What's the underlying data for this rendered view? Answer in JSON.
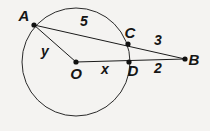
{
  "figure": {
    "kind": "circle-secant-geometry-diagram",
    "background_color": "#f4f3f1",
    "stroke_color": "#1b1b1b",
    "label_color": "#151515",
    "points": [
      {
        "id": "A",
        "label": "A",
        "cx": 34,
        "cy": 25,
        "label_x": 24,
        "label_y": 17
      },
      {
        "id": "C",
        "label": "C",
        "cx": 128,
        "cy": 44,
        "label_x": 130,
        "label_y": 34
      },
      {
        "id": "D",
        "label": "D",
        "cx": 129,
        "cy": 62,
        "label_x": 133,
        "label_y": 72
      },
      {
        "id": "B",
        "label": "B",
        "cx": 185,
        "cy": 59,
        "label_x": 194,
        "label_y": 61
      },
      {
        "id": "O",
        "label": "O",
        "cx": 76,
        "cy": 62,
        "label_x": 76,
        "label_y": 75
      }
    ],
    "circle": {
      "cx": 76,
      "cy": 62,
      "r": 54
    },
    "segments": [
      {
        "id": "AB",
        "from": "A",
        "to": "B",
        "x1": 34,
        "y1": 25,
        "x2": 185,
        "y2": 59
      },
      {
        "id": "OB",
        "from": "O",
        "to": "B",
        "x1": 76,
        "y1": 62,
        "x2": 185,
        "y2": 59
      },
      {
        "id": "AO",
        "from": "A",
        "to": "O",
        "x1": 34,
        "y1": 25,
        "x2": 76,
        "y2": 62
      }
    ],
    "measure_labels": [
      {
        "id": "AC",
        "text": "5",
        "x": 84,
        "y": 22,
        "for_segment": "A-C"
      },
      {
        "id": "AO",
        "text": "y",
        "x": 45,
        "y": 52,
        "for_segment": "A-O"
      },
      {
        "id": "OD",
        "text": "x",
        "x": 105,
        "y": 70,
        "for_segment": "O-D"
      },
      {
        "id": "CB",
        "text": "3",
        "x": 158,
        "y": 41,
        "for_segment": "C-B"
      },
      {
        "id": "DB",
        "text": "2",
        "x": 158,
        "y": 69,
        "for_segment": "D-B"
      }
    ]
  }
}
